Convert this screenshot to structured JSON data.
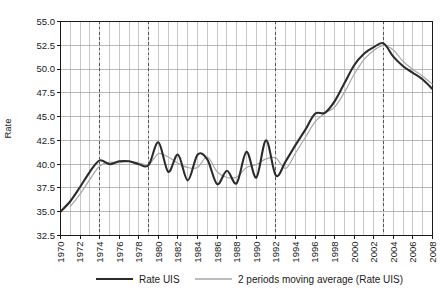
{
  "chart_data": {
    "type": "line",
    "title": "",
    "xlabel": "",
    "ylabel": "Rate",
    "ylim": [
      32.5,
      55.0
    ],
    "xlim": [
      1970,
      2008
    ],
    "yticks": [
      "32.5",
      "35.0",
      "37.5",
      "40.0",
      "42.5",
      "45.0",
      "47.5",
      "50.0",
      "52.5",
      "55.0"
    ],
    "ytick_values": [
      32.5,
      35.0,
      37.5,
      40.0,
      42.5,
      45.0,
      47.5,
      50.0,
      52.5,
      55.0
    ],
    "xticks": [
      "1970",
      "1972",
      "1974",
      "1976",
      "1978",
      "1980",
      "1982",
      "1984",
      "1986",
      "1988",
      "1990",
      "1992",
      "1994",
      "1996",
      "1998",
      "2000",
      "2002",
      "2004",
      "2006",
      "2008"
    ],
    "xtick_values": [
      1970,
      1972,
      1974,
      1976,
      1978,
      1980,
      1982,
      1984,
      1986,
      1988,
      1990,
      1992,
      1994,
      1996,
      1998,
      2000,
      2002,
      2004,
      2006,
      2008
    ],
    "grid": true,
    "grid_minor_x": true,
    "legend_position": "bottom",
    "annotations": {
      "vertical_dashed_lines": [
        1974,
        1979,
        1992,
        2003
      ]
    },
    "x": [
      1970,
      1971,
      1972,
      1973,
      1974,
      1975,
      1976,
      1977,
      1978,
      1979,
      1980,
      1981,
      1982,
      1983,
      1984,
      1985,
      1986,
      1987,
      1988,
      1989,
      1990,
      1991,
      1992,
      1993,
      1994,
      1995,
      1996,
      1997,
      1998,
      1999,
      2000,
      2001,
      2002,
      2003,
      2004,
      2005,
      2006,
      2007,
      2008
    ],
    "series": [
      {
        "name": "Rate UIS",
        "color": "#2b2b2b",
        "width": 2.1,
        "values": [
          35.0,
          36.1,
          37.6,
          39.2,
          40.4,
          40.0,
          40.3,
          40.3,
          40.0,
          39.9,
          42.3,
          39.2,
          41.0,
          38.3,
          41.0,
          40.5,
          37.9,
          39.3,
          38.0,
          41.3,
          38.6,
          42.5,
          38.8,
          40.3,
          42.0,
          43.6,
          45.3,
          45.4,
          46.6,
          48.5,
          50.4,
          51.6,
          52.3,
          52.7,
          51.3,
          50.3,
          49.6,
          48.9,
          47.9
        ]
      },
      {
        "name": "2 periods moving average (Rate UIS)",
        "color": "#a6a6a6",
        "width": 1.2,
        "values": [
          null,
          35.55,
          36.85,
          38.4,
          39.8,
          40.2,
          40.15,
          40.3,
          40.15,
          39.95,
          41.1,
          40.75,
          40.1,
          39.65,
          39.65,
          40.75,
          39.2,
          38.6,
          38.65,
          39.65,
          39.95,
          40.55,
          40.65,
          39.55,
          41.15,
          42.8,
          44.45,
          45.35,
          46.0,
          47.55,
          49.45,
          51.0,
          51.95,
          52.5,
          52.0,
          50.8,
          49.95,
          49.25,
          48.4
        ]
      }
    ]
  },
  "legend": {
    "items": [
      {
        "label": "Rate UIS",
        "color": "#2b2b2b"
      },
      {
        "label": "2 periods moving average (Rate UIS)",
        "color": "#a6a6a6"
      }
    ]
  },
  "axes": {
    "y_axis_title": "Rate"
  },
  "colors": {
    "series_main": "#2b2b2b",
    "series_moving_average": "#a6a6a6",
    "grid": "#9a9a9a",
    "axis": "#1a1a1a",
    "dashed_marker": "#555555",
    "background": "#ffffff"
  }
}
